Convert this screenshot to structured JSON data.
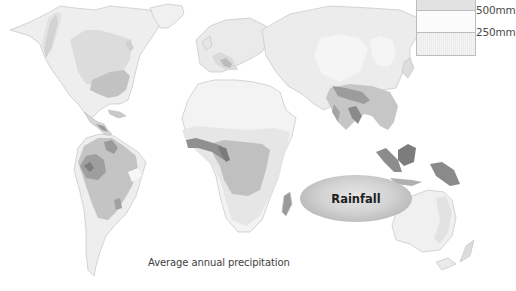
{
  "map": {
    "title": "Rainfall",
    "caption": "Average annual precipitation",
    "legend": {
      "items": [
        {
          "label": "500mm",
          "swatch": "#e4e4e4"
        },
        {
          "label": "250mm",
          "swatch": "#fbfbfb"
        },
        {
          "label": "",
          "swatch": "#ececec"
        }
      ]
    },
    "colors": {
      "background": "#ffffff",
      "very_dry": "#f3f3f3",
      "dry": "#e6e6e6",
      "moderate": "#d6d6d6",
      "wet": "#b9b9b9",
      "very_wet": "#9a9a9a",
      "wettest": "#7a7a7a"
    }
  }
}
